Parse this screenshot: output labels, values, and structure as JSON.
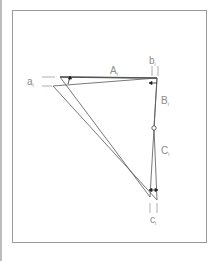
{
  "diagram": {
    "labels": {
      "a": {
        "main": "a",
        "sub": "i"
      },
      "A": {
        "main": "A",
        "sub": "i"
      },
      "b": {
        "main": "b",
        "sub": "i"
      },
      "B": {
        "main": "B",
        "sub": "i"
      },
      "C": {
        "main": "C",
        "sub": "i"
      },
      "c": {
        "main": "c",
        "sub": "i"
      }
    },
    "colors": {
      "line": "#555555",
      "label": "#8a8a8a",
      "frame": "#9a9a9a",
      "arrow": "#222222"
    }
  }
}
